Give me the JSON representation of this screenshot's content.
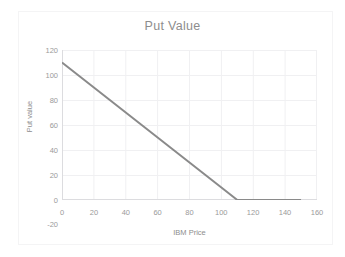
{
  "chart_data": {
    "type": "line",
    "title": "Put Value",
    "xlabel": "IBM Price",
    "ylabel": "Put value",
    "xlim": [
      0,
      160
    ],
    "ylim": [
      0,
      120
    ],
    "y_axis_extra_label": "-20",
    "grid": true,
    "legend": "none",
    "xticks": [
      "0",
      "20",
      "40",
      "60",
      "80",
      "100",
      "120",
      "140",
      "160"
    ],
    "yticks": [
      "120",
      "100",
      "80",
      "60",
      "40",
      "20",
      "0"
    ],
    "xtick_values": [
      0,
      20,
      40,
      60,
      80,
      100,
      120,
      140,
      160
    ],
    "ytick_values": [
      120,
      100,
      80,
      60,
      40,
      20,
      0
    ],
    "series": [
      {
        "name": "Put value",
        "color": "#8a8a8a",
        "line_width": 2,
        "x": [
          0,
          10,
          20,
          30,
          40,
          50,
          60,
          70,
          80,
          90,
          100,
          110,
          120,
          130,
          140,
          150
        ],
        "values": [
          110,
          100,
          90,
          80,
          70,
          60,
          50,
          40,
          30,
          20,
          10,
          0,
          0,
          0,
          0,
          0
        ]
      }
    ],
    "annotations": {
      "strike": 110,
      "max_value_at_zero_price": 110,
      "zero_beyond": 110
    }
  },
  "colors": {
    "title": "#8d8d8d",
    "tick_label": "#9a9a9a",
    "axis_title": "#8d8d8d",
    "grid": "#f0f0f2",
    "axis_line": "#d9d9dc",
    "series": "#8a8a8a",
    "background": "#ffffff",
    "frame": "#f4f4f5"
  }
}
